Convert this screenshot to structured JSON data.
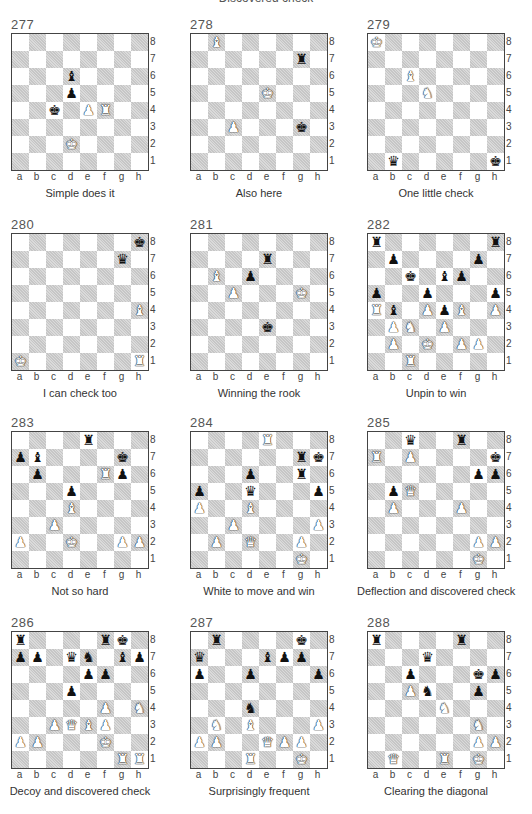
{
  "page": {
    "section_title": "Discovered check",
    "files": [
      "a",
      "b",
      "c",
      "d",
      "e",
      "f",
      "g",
      "h"
    ],
    "ranks": [
      "8",
      "7",
      "6",
      "5",
      "4",
      "3",
      "2",
      "1"
    ]
  },
  "piece_glyphs": {
    "K": "♚",
    "Q": "♛",
    "R": "♜",
    "B": "♝",
    "N": "♞",
    "P": "♟"
  },
  "diagrams": [
    {
      "number": "277",
      "caption": "Simple does it",
      "pieces": [
        [
          "d6",
          "b",
          "B"
        ],
        [
          "d5",
          "b",
          "P"
        ],
        [
          "c4",
          "b",
          "K"
        ],
        [
          "e4",
          "w",
          "P"
        ],
        [
          "f4",
          "w",
          "R"
        ],
        [
          "d2",
          "w",
          "K"
        ]
      ]
    },
    {
      "number": "278",
      "caption": "Also here",
      "pieces": [
        [
          "b8",
          "w",
          "B"
        ],
        [
          "g7",
          "b",
          "R"
        ],
        [
          "e5",
          "w",
          "K"
        ],
        [
          "c3",
          "w",
          "P"
        ],
        [
          "g3",
          "b",
          "K"
        ]
      ]
    },
    {
      "number": "279",
      "caption": "One little check",
      "pieces": [
        [
          "a8",
          "w",
          "K"
        ],
        [
          "c6",
          "w",
          "B"
        ],
        [
          "d5",
          "w",
          "N"
        ],
        [
          "b1",
          "b",
          "Q"
        ],
        [
          "h1",
          "b",
          "K"
        ]
      ]
    },
    {
      "number": "280",
      "caption": "I can check too",
      "pieces": [
        [
          "h8",
          "b",
          "K"
        ],
        [
          "g7",
          "b",
          "Q"
        ],
        [
          "h4",
          "w",
          "B"
        ],
        [
          "a1",
          "w",
          "K"
        ],
        [
          "h1",
          "w",
          "R"
        ]
      ]
    },
    {
      "number": "281",
      "caption": "Winning the  rook",
      "pieces": [
        [
          "e7",
          "b",
          "R"
        ],
        [
          "b6",
          "w",
          "B"
        ],
        [
          "d6",
          "b",
          "P"
        ],
        [
          "c5",
          "w",
          "P"
        ],
        [
          "g5",
          "w",
          "K"
        ],
        [
          "e3",
          "b",
          "K"
        ]
      ]
    },
    {
      "number": "282",
      "caption": "Unpin to win",
      "pieces": [
        [
          "a8",
          "b",
          "R"
        ],
        [
          "h8",
          "b",
          "R"
        ],
        [
          "b7",
          "b",
          "P"
        ],
        [
          "g7",
          "b",
          "P"
        ],
        [
          "c6",
          "b",
          "K"
        ],
        [
          "e6",
          "b",
          "B"
        ],
        [
          "f6",
          "b",
          "P"
        ],
        [
          "a5",
          "b",
          "P"
        ],
        [
          "d5",
          "b",
          "P"
        ],
        [
          "h5",
          "b",
          "P"
        ],
        [
          "a4",
          "w",
          "R"
        ],
        [
          "b4",
          "b",
          "B"
        ],
        [
          "d4",
          "w",
          "P"
        ],
        [
          "e4",
          "b",
          "P"
        ],
        [
          "f4",
          "w",
          "B"
        ],
        [
          "h4",
          "w",
          "P"
        ],
        [
          "b3",
          "w",
          "P"
        ],
        [
          "c3",
          "w",
          "N"
        ],
        [
          "e3",
          "w",
          "P"
        ],
        [
          "b2",
          "w",
          "P"
        ],
        [
          "d2",
          "w",
          "K"
        ],
        [
          "f2",
          "w",
          "P"
        ],
        [
          "g2",
          "w",
          "P"
        ],
        [
          "c1",
          "w",
          "R"
        ]
      ]
    },
    {
      "number": "283",
      "caption": "Not so hard",
      "pieces": [
        [
          "e8",
          "b",
          "R"
        ],
        [
          "a7",
          "b",
          "P"
        ],
        [
          "b7",
          "b",
          "B"
        ],
        [
          "g7",
          "b",
          "K"
        ],
        [
          "b6",
          "b",
          "P"
        ],
        [
          "f6",
          "w",
          "R"
        ],
        [
          "g6",
          "b",
          "P"
        ],
        [
          "d5",
          "b",
          "P"
        ],
        [
          "d4",
          "w",
          "B"
        ],
        [
          "c3",
          "w",
          "P"
        ],
        [
          "a2",
          "w",
          "P"
        ],
        [
          "d2",
          "w",
          "K"
        ],
        [
          "g2",
          "w",
          "P"
        ],
        [
          "h2",
          "w",
          "P"
        ]
      ]
    },
    {
      "number": "284",
      "caption": "White to move and win",
      "pieces": [
        [
          "e8",
          "w",
          "R"
        ],
        [
          "g7",
          "b",
          "R"
        ],
        [
          "h7",
          "b",
          "K"
        ],
        [
          "d6",
          "b",
          "P"
        ],
        [
          "g6",
          "b",
          "R"
        ],
        [
          "a5",
          "b",
          "P"
        ],
        [
          "d5",
          "b",
          "Q"
        ],
        [
          "h5",
          "b",
          "P"
        ],
        [
          "a4",
          "w",
          "P"
        ],
        [
          "d4",
          "w",
          "B"
        ],
        [
          "c3",
          "w",
          "P"
        ],
        [
          "h3",
          "w",
          "P"
        ],
        [
          "b2",
          "w",
          "P"
        ],
        [
          "d2",
          "w",
          "Q"
        ],
        [
          "g2",
          "w",
          "P"
        ],
        [
          "g1",
          "w",
          "K"
        ]
      ]
    },
    {
      "number": "285",
      "caption": "Deflection and discovered check",
      "pieces": [
        [
          "c8",
          "b",
          "Q"
        ],
        [
          "f8",
          "b",
          "R"
        ],
        [
          "a7",
          "w",
          "R"
        ],
        [
          "c7",
          "w",
          "P"
        ],
        [
          "h7",
          "b",
          "K"
        ],
        [
          "g6",
          "b",
          "P"
        ],
        [
          "h6",
          "b",
          "P"
        ],
        [
          "b5",
          "b",
          "P"
        ],
        [
          "c5",
          "w",
          "Q"
        ],
        [
          "b4",
          "w",
          "P"
        ],
        [
          "f4",
          "w",
          "P"
        ],
        [
          "g2",
          "w",
          "P"
        ],
        [
          "h2",
          "w",
          "P"
        ],
        [
          "g1",
          "w",
          "K"
        ]
      ]
    },
    {
      "number": "286",
      "caption": "Decoy and discovered check",
      "pieces": [
        [
          "a8",
          "b",
          "R"
        ],
        [
          "f8",
          "b",
          "R"
        ],
        [
          "g8",
          "b",
          "K"
        ],
        [
          "a7",
          "b",
          "P"
        ],
        [
          "b7",
          "b",
          "P"
        ],
        [
          "d7",
          "b",
          "Q"
        ],
        [
          "e7",
          "b",
          "N"
        ],
        [
          "g7",
          "b",
          "B"
        ],
        [
          "h7",
          "b",
          "P"
        ],
        [
          "e6",
          "b",
          "P"
        ],
        [
          "f6",
          "b",
          "P"
        ],
        [
          "d5",
          "b",
          "P"
        ],
        [
          "f4",
          "w",
          "P"
        ],
        [
          "h4",
          "w",
          "N"
        ],
        [
          "c3",
          "w",
          "P"
        ],
        [
          "d3",
          "w",
          "Q"
        ],
        [
          "e3",
          "w",
          "B"
        ],
        [
          "f3",
          "w",
          "P"
        ],
        [
          "a2",
          "w",
          "P"
        ],
        [
          "b2",
          "w",
          "P"
        ],
        [
          "f2",
          "w",
          "K"
        ],
        [
          "g1",
          "w",
          "R"
        ],
        [
          "h1",
          "w",
          "R"
        ]
      ]
    },
    {
      "number": "287",
      "caption": "Surprisingly frequent",
      "pieces": [
        [
          "b8",
          "b",
          "R"
        ],
        [
          "g8",
          "b",
          "K"
        ],
        [
          "a7",
          "b",
          "Q"
        ],
        [
          "e7",
          "b",
          "B"
        ],
        [
          "f7",
          "b",
          "P"
        ],
        [
          "g7",
          "b",
          "P"
        ],
        [
          "a6",
          "b",
          "P"
        ],
        [
          "d6",
          "b",
          "P"
        ],
        [
          "h6",
          "b",
          "P"
        ],
        [
          "d4",
          "b",
          "N"
        ],
        [
          "b3",
          "w",
          "N"
        ],
        [
          "d3",
          "w",
          "B"
        ],
        [
          "h3",
          "w",
          "P"
        ],
        [
          "a2",
          "w",
          "P"
        ],
        [
          "b2",
          "w",
          "P"
        ],
        [
          "e2",
          "w",
          "Q"
        ],
        [
          "f2",
          "w",
          "P"
        ],
        [
          "g2",
          "w",
          "P"
        ],
        [
          "d1",
          "w",
          "R"
        ],
        [
          "g1",
          "w",
          "K"
        ]
      ]
    },
    {
      "number": "288",
      "caption": "Clearing the diagonal",
      "pieces": [
        [
          "a8",
          "b",
          "R"
        ],
        [
          "f8",
          "b",
          "R"
        ],
        [
          "d7",
          "b",
          "Q"
        ],
        [
          "c6",
          "b",
          "P"
        ],
        [
          "g6",
          "b",
          "K"
        ],
        [
          "h6",
          "b",
          "P"
        ],
        [
          "c5",
          "w",
          "P"
        ],
        [
          "d5",
          "b",
          "N"
        ],
        [
          "g5",
          "b",
          "P"
        ],
        [
          "e4",
          "w",
          "N"
        ],
        [
          "g3",
          "w",
          "N"
        ],
        [
          "g2",
          "w",
          "P"
        ],
        [
          "h2",
          "w",
          "P"
        ],
        [
          "b1",
          "w",
          "Q"
        ],
        [
          "e1",
          "w",
          "R"
        ],
        [
          "g1",
          "w",
          "K"
        ]
      ]
    }
  ]
}
